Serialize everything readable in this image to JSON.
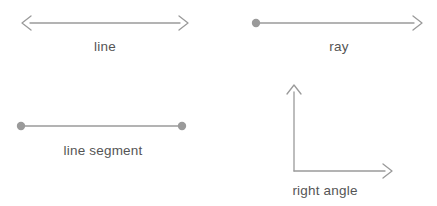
{
  "canvas": {
    "width": 437,
    "height": 206,
    "background": "#ffffff"
  },
  "style": {
    "stroke_color": "#9a9a9a",
    "dot_color": "#9a9a9a",
    "text_color": "#555555",
    "stroke_width": 1.3,
    "dot_radius": 4,
    "label_font_size": 13.5
  },
  "figures": [
    {
      "id": "line",
      "label": "line",
      "kind": "double-arrow",
      "label_x": 105,
      "label_y": 47,
      "geometry": {
        "x1": 22,
        "y1": 23,
        "x2": 188,
        "y2": 23,
        "arrow_start": true,
        "arrow_end": true,
        "dot_start": false,
        "dot_end": false
      }
    },
    {
      "id": "ray",
      "label": "ray",
      "kind": "dot-and-arrow",
      "label_x": 339,
      "label_y": 47,
      "geometry": {
        "x1": 255,
        "y1": 23,
        "x2": 422,
        "y2": 23,
        "arrow_start": false,
        "arrow_end": true,
        "dot_start": true,
        "dot_end": false
      }
    },
    {
      "id": "line-segment",
      "label": "line segment",
      "kind": "double-dot",
      "label_x": 103,
      "label_y": 151,
      "geometry": {
        "x1": 20,
        "y1": 126,
        "x2": 183,
        "y2": 126,
        "arrow_start": false,
        "arrow_end": false,
        "dot_start": true,
        "dot_end": true
      }
    },
    {
      "id": "right-angle",
      "label": "right angle",
      "kind": "perpendicular-rays",
      "label_x": 325,
      "label_y": 191,
      "geometry": {
        "vertex_x": 294,
        "vertex_y": 171,
        "vertical_tip_y": 85,
        "horizontal_tip_x": 392,
        "angle_degrees": 90,
        "arrow_vertical": true,
        "arrow_horizontal": true
      }
    }
  ]
}
